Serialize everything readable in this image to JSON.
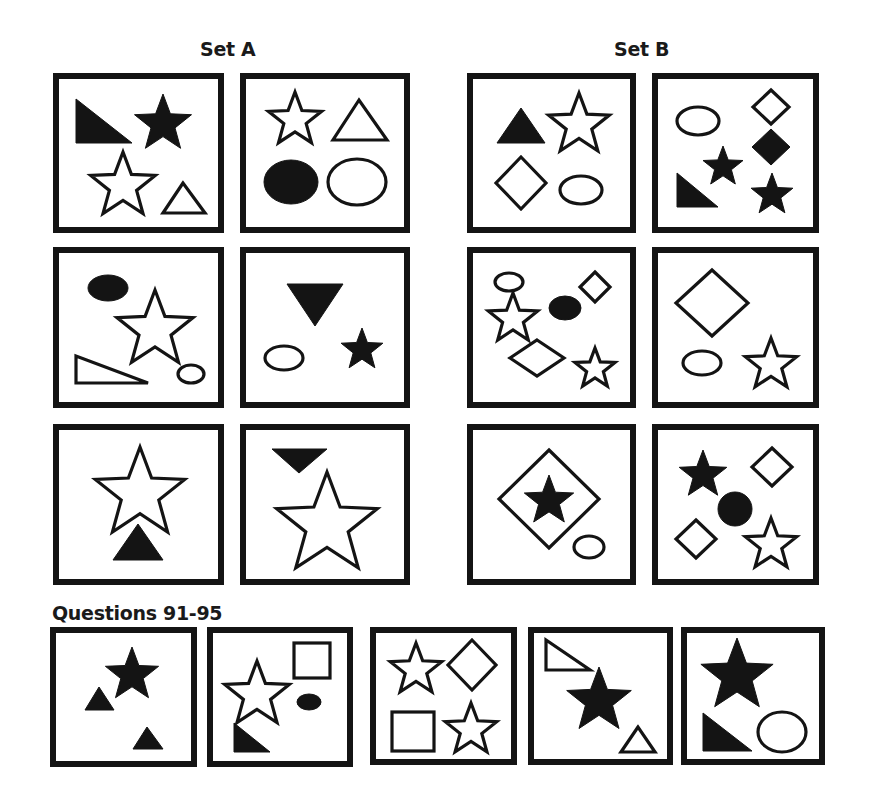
{
  "titles": {
    "set_a": "Set A",
    "set_b": "Set B",
    "questions": "Questions 91-95"
  },
  "colors": {
    "ink": "#141414",
    "background": "#ffffff"
  },
  "panels": [
    {
      "id": "set-a-1",
      "group": "Set A",
      "x": 53,
      "y": 73,
      "w": 171,
      "h": 160,
      "shapes": [
        {
          "type": "polygon",
          "fill": true,
          "points": [
            [
              23,
              26
            ],
            [
              23,
              70
            ],
            [
              79,
              70
            ]
          ],
          "label": "filled right triangle"
        },
        {
          "type": "star",
          "fill": true,
          "cx": 110,
          "cy": 51,
          "r": 30,
          "label": "filled star"
        },
        {
          "type": "star",
          "fill": false,
          "cx": 70,
          "cy": 113,
          "r": 34,
          "label": "outline star"
        },
        {
          "type": "polygon",
          "fill": false,
          "points": [
            [
              130,
              110
            ],
            [
              110,
              140
            ],
            [
              152,
              140
            ]
          ],
          "label": "outline triangle"
        }
      ]
    },
    {
      "id": "set-a-2",
      "group": "Set A",
      "x": 240,
      "y": 73,
      "w": 170,
      "h": 160,
      "shapes": [
        {
          "type": "star",
          "fill": false,
          "cx": 55,
          "cy": 47,
          "r": 28,
          "label": "outline star"
        },
        {
          "type": "polygon",
          "fill": false,
          "points": [
            [
              119,
              27
            ],
            [
              93,
              67
            ],
            [
              147,
              67
            ]
          ],
          "label": "outline triangle"
        },
        {
          "type": "ellipse",
          "fill": true,
          "cx": 51,
          "cy": 109,
          "rx": 27,
          "ry": 22,
          "label": "filled ellipse"
        },
        {
          "type": "ellipse",
          "fill": false,
          "cx": 117,
          "cy": 109,
          "rx": 29,
          "ry": 23,
          "label": "outline ellipse"
        }
      ]
    },
    {
      "id": "set-b-1",
      "group": "Set B",
      "x": 467,
      "y": 73,
      "w": 169,
      "h": 160,
      "shapes": [
        {
          "type": "polygon",
          "fill": true,
          "points": [
            [
              54,
              35
            ],
            [
              30,
              70
            ],
            [
              78,
              70
            ]
          ],
          "label": "filled triangle"
        },
        {
          "type": "star",
          "fill": false,
          "cx": 112,
          "cy": 52,
          "r": 32,
          "label": "outline star"
        },
        {
          "type": "diamond",
          "fill": false,
          "cx": 54,
          "cy": 110,
          "hw": 25,
          "hh": 26,
          "label": "outline diamond"
        },
        {
          "type": "ellipse",
          "fill": false,
          "cx": 114,
          "cy": 117,
          "rx": 21,
          "ry": 14,
          "label": "outline ellipse"
        }
      ]
    },
    {
      "id": "set-b-2",
      "group": "Set B",
      "x": 652,
      "y": 73,
      "w": 167,
      "h": 160,
      "shapes": [
        {
          "type": "ellipse",
          "fill": false,
          "cx": 46,
          "cy": 48,
          "rx": 21,
          "ry": 14,
          "label": "outline ellipse"
        },
        {
          "type": "diamond",
          "fill": false,
          "cx": 119,
          "cy": 34,
          "hw": 18,
          "hh": 17,
          "label": "outline diamond"
        },
        {
          "type": "diamond",
          "fill": true,
          "cx": 119,
          "cy": 74,
          "hw": 19,
          "hh": 18,
          "label": "filled diamond"
        },
        {
          "type": "star",
          "fill": true,
          "cx": 71,
          "cy": 94,
          "r": 21,
          "label": "filled star"
        },
        {
          "type": "polygon",
          "fill": true,
          "points": [
            [
              25,
              100
            ],
            [
              25,
              134
            ],
            [
              66,
              134
            ]
          ],
          "label": "filled right triangle"
        },
        {
          "type": "star",
          "fill": true,
          "cx": 120,
          "cy": 122,
          "r": 22,
          "label": "filled star"
        }
      ]
    },
    {
      "id": "set-a-3",
      "group": "Set A",
      "x": 53,
      "y": 247,
      "w": 171,
      "h": 161,
      "shapes": [
        {
          "type": "ellipse",
          "fill": true,
          "cx": 55,
          "cy": 41,
          "rx": 20,
          "ry": 13,
          "label": "filled ellipse"
        },
        {
          "type": "star",
          "fill": false,
          "cx": 102,
          "cy": 83,
          "r": 40,
          "label": "outline star"
        },
        {
          "type": "polygon",
          "fill": false,
          "points": [
            [
              23,
              109
            ],
            [
              23,
              136
            ],
            [
              95,
              136
            ]
          ],
          "label": "outline triangle"
        },
        {
          "type": "ellipse",
          "fill": false,
          "cx": 138,
          "cy": 127,
          "rx": 13,
          "ry": 9,
          "label": "outline ellipse"
        }
      ]
    },
    {
      "id": "set-a-4",
      "group": "Set A",
      "x": 240,
      "y": 247,
      "w": 170,
      "h": 161,
      "shapes": [
        {
          "type": "polygon",
          "fill": true,
          "points": [
            [
              47,
              37
            ],
            [
              103,
              37
            ],
            [
              75,
              79
            ]
          ],
          "label": "filled inverted triangle"
        },
        {
          "type": "ellipse",
          "fill": false,
          "cx": 44,
          "cy": 111,
          "rx": 19,
          "ry": 12,
          "label": "outline ellipse"
        },
        {
          "type": "star",
          "fill": true,
          "cx": 122,
          "cy": 103,
          "r": 22,
          "label": "filled star"
        }
      ]
    },
    {
      "id": "set-b-3",
      "group": "Set B",
      "x": 467,
      "y": 247,
      "w": 169,
      "h": 161,
      "shapes": [
        {
          "type": "ellipse",
          "fill": false,
          "cx": 42,
          "cy": 35,
          "rx": 14,
          "ry": 9,
          "label": "outline ellipse"
        },
        {
          "type": "star",
          "fill": false,
          "cx": 46,
          "cy": 72,
          "r": 26,
          "label": "outline star"
        },
        {
          "type": "ellipse",
          "fill": true,
          "cx": 98,
          "cy": 61,
          "rx": 16,
          "ry": 12,
          "label": "filled ellipse"
        },
        {
          "type": "diamond",
          "fill": false,
          "cx": 128,
          "cy": 40,
          "hw": 15,
          "hh": 15,
          "label": "outline diamond"
        },
        {
          "type": "diamond",
          "fill": false,
          "cx": 70,
          "cy": 111,
          "hw": 27,
          "hh": 18,
          "label": "outline diamond"
        },
        {
          "type": "star",
          "fill": false,
          "cx": 128,
          "cy": 122,
          "r": 21,
          "label": "outline star"
        }
      ]
    },
    {
      "id": "set-b-4",
      "group": "Set B",
      "x": 652,
      "y": 247,
      "w": 167,
      "h": 161,
      "shapes": [
        {
          "type": "diamond",
          "fill": false,
          "cx": 60,
          "cy": 56,
          "hw": 36,
          "hh": 33,
          "label": "outline diamond"
        },
        {
          "type": "ellipse",
          "fill": false,
          "cx": 50,
          "cy": 116,
          "rx": 19,
          "ry": 12,
          "label": "outline ellipse"
        },
        {
          "type": "star",
          "fill": false,
          "cx": 119,
          "cy": 118,
          "r": 27,
          "label": "outline star"
        }
      ]
    },
    {
      "id": "set-a-5",
      "group": "Set A",
      "x": 53,
      "y": 424,
      "w": 171,
      "h": 161,
      "shapes": [
        {
          "type": "star",
          "fill": false,
          "cx": 87,
          "cy": 70,
          "r": 47,
          "label": "outline star"
        },
        {
          "type": "polygon",
          "fill": true,
          "points": [
            [
              85,
              100
            ],
            [
              60,
              136
            ],
            [
              110,
              136
            ]
          ],
          "label": "filled triangle"
        }
      ]
    },
    {
      "id": "set-a-6",
      "group": "Set A",
      "x": 240,
      "y": 424,
      "w": 170,
      "h": 161,
      "shapes": [
        {
          "type": "polygon",
          "fill": true,
          "points": [
            [
              32,
              25
            ],
            [
              87,
              25
            ],
            [
              59,
              49
            ]
          ],
          "label": "filled inverted triangle"
        },
        {
          "type": "star",
          "fill": false,
          "cx": 87,
          "cy": 101,
          "r": 53,
          "label": "outline star"
        }
      ]
    },
    {
      "id": "set-b-5",
      "group": "Set B",
      "x": 467,
      "y": 424,
      "w": 169,
      "h": 161,
      "shapes": [
        {
          "type": "diamond",
          "fill": false,
          "cx": 82,
          "cy": 75,
          "hw": 50,
          "hh": 49,
          "label": "outline diamond"
        },
        {
          "type": "star",
          "fill": true,
          "cx": 82,
          "cy": 77,
          "r": 26,
          "label": "filled star"
        },
        {
          "type": "ellipse",
          "fill": false,
          "cx": 122,
          "cy": 123,
          "rx": 15,
          "ry": 11,
          "label": "outline ellipse"
        }
      ]
    },
    {
      "id": "set-b-6",
      "group": "Set B",
      "x": 652,
      "y": 424,
      "w": 167,
      "h": 161,
      "shapes": [
        {
          "type": "star",
          "fill": true,
          "cx": 51,
          "cy": 51,
          "r": 25,
          "label": "filled star"
        },
        {
          "type": "diamond",
          "fill": false,
          "cx": 120,
          "cy": 43,
          "hw": 20,
          "hh": 19,
          "label": "outline diamond"
        },
        {
          "type": "ellipse",
          "fill": true,
          "cx": 83,
          "cy": 85,
          "rx": 17,
          "ry": 17,
          "label": "filled circle"
        },
        {
          "type": "diamond",
          "fill": false,
          "cx": 44,
          "cy": 115,
          "hw": 20,
          "hh": 19,
          "label": "outline diamond"
        },
        {
          "type": "star",
          "fill": false,
          "cx": 119,
          "cy": 121,
          "r": 27,
          "label": "outline star"
        }
      ]
    },
    {
      "id": "question-91",
      "group": "Questions",
      "x": 50,
      "y": 627,
      "w": 147,
      "h": 140,
      "shapes": [
        {
          "type": "star",
          "fill": true,
          "cx": 82,
          "cy": 48,
          "r": 28,
          "label": "filled star"
        },
        {
          "type": "polygon",
          "fill": true,
          "points": [
            [
              49,
              60
            ],
            [
              35,
              83
            ],
            [
              64,
              83
            ]
          ],
          "label": "filled triangle"
        },
        {
          "type": "polygon",
          "fill": true,
          "points": [
            [
              97,
              100
            ],
            [
              83,
              122
            ],
            [
              113,
              122
            ]
          ],
          "label": "filled triangle"
        }
      ]
    },
    {
      "id": "question-92",
      "group": "Questions",
      "x": 207,
      "y": 627,
      "w": 146,
      "h": 140,
      "shapes": [
        {
          "type": "rect",
          "fill": false,
          "x": 87,
          "y": 16,
          "w": 36,
          "h": 35,
          "label": "outline square"
        },
        {
          "type": "star",
          "fill": false,
          "cx": 50,
          "cy": 68,
          "r": 34,
          "label": "outline star"
        },
        {
          "type": "ellipse",
          "fill": true,
          "cx": 102,
          "cy": 75,
          "rx": 12,
          "ry": 8,
          "label": "filled ellipse"
        },
        {
          "type": "polygon",
          "fill": true,
          "points": [
            [
              27,
              96
            ],
            [
              27,
              125
            ],
            [
              63,
              125
            ]
          ],
          "label": "filled right triangle"
        }
      ]
    },
    {
      "id": "question-93",
      "group": "Questions",
      "x": 370,
      "y": 627,
      "w": 147,
      "h": 138,
      "shapes": [
        {
          "type": "star",
          "fill": false,
          "cx": 46,
          "cy": 43,
          "r": 27,
          "label": "outline star"
        },
        {
          "type": "diamond",
          "fill": false,
          "cx": 102,
          "cy": 38,
          "hw": 24,
          "hh": 25,
          "label": "outline diamond"
        },
        {
          "type": "rect",
          "fill": false,
          "x": 22,
          "y": 85,
          "w": 42,
          "h": 39,
          "label": "outline square"
        },
        {
          "type": "star",
          "fill": false,
          "cx": 101,
          "cy": 103,
          "r": 27,
          "label": "outline star"
        }
      ]
    },
    {
      "id": "question-94",
      "group": "Questions",
      "x": 528,
      "y": 627,
      "w": 145,
      "h": 138,
      "shapes": [
        {
          "type": "polygon",
          "fill": false,
          "points": [
            [
              18,
              13
            ],
            [
              18,
              43
            ],
            [
              62,
              43
            ]
          ],
          "label": "outline right triangle"
        },
        {
          "type": "star",
          "fill": true,
          "cx": 71,
          "cy": 74,
          "r": 34,
          "label": "filled star"
        },
        {
          "type": "polygon",
          "fill": false,
          "points": [
            [
              110,
              100
            ],
            [
              93,
              125
            ],
            [
              127,
              125
            ]
          ],
          "label": "outline triangle"
        }
      ]
    },
    {
      "id": "question-95",
      "group": "Questions",
      "x": 681,
      "y": 627,
      "w": 144,
      "h": 138,
      "shapes": [
        {
          "type": "star",
          "fill": true,
          "cx": 56,
          "cy": 49,
          "r": 38,
          "label": "filled star"
        },
        {
          "type": "polygon",
          "fill": true,
          "points": [
            [
              22,
              86
            ],
            [
              22,
              124
            ],
            [
              71,
              124
            ]
          ],
          "label": "filled right triangle"
        },
        {
          "type": "ellipse",
          "fill": false,
          "cx": 101,
          "cy": 105,
          "rx": 24,
          "ry": 20,
          "label": "outline ellipse"
        }
      ]
    }
  ]
}
